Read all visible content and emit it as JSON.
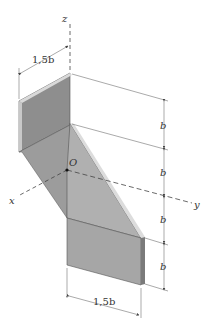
{
  "diagram": {
    "type": "isometric-bent-plate",
    "axes": {
      "x_label": "x",
      "y_label": "y",
      "z_label": "z",
      "origin_label": "O"
    },
    "dimensions": {
      "top_width": "1,5b",
      "bottom_width": "1,5b",
      "vertical_1": "b",
      "vertical_2": "b",
      "vertical_3": "b",
      "vertical_4": "b"
    },
    "colors": {
      "plate_dark": "#8e8e8e",
      "plate_mid": "#a8a8a8",
      "plate_light": "#bdbdbd",
      "edge_light": "#d9d9d9",
      "line": "#444444"
    }
  }
}
